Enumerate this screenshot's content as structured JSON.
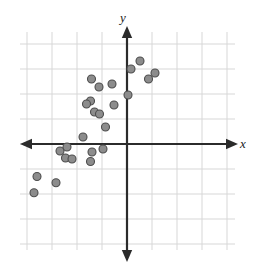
{
  "chart_data": {
    "type": "scatter",
    "title": "",
    "subtitle": "",
    "xlabel": "x",
    "ylabel": "y",
    "xlim": [
      -4.3,
      4.3
    ],
    "ylim": [
      -4.3,
      4.3
    ],
    "grid": true,
    "grid_spacing": 1,
    "legend": null,
    "annotations": [],
    "axes": {
      "x_axis_visible": true,
      "y_axis_visible": true,
      "x_axis_arrows": "both",
      "y_axis_arrows": "both",
      "tick_labels": false,
      "origin_label": ""
    },
    "series": [
      {
        "name": "data",
        "marker": "circle",
        "marker_fill": "#8c8c8c",
        "marker_edge": "#4d4d4d",
        "marker_size": 8,
        "points": [
          [
            -3.6,
            -1.3
          ],
          [
            -3.72,
            -1.95
          ],
          [
            -2.84,
            -1.55
          ],
          [
            -2.68,
            -0.28
          ],
          [
            -2.4,
            -0.12
          ],
          [
            -2.46,
            -0.56
          ],
          [
            -2.2,
            -0.6
          ],
          [
            -1.76,
            0.28
          ],
          [
            -1.4,
            -0.32
          ],
          [
            -1.46,
            -0.7
          ],
          [
            -0.96,
            -0.2
          ],
          [
            -0.86,
            0.68
          ],
          [
            -1.3,
            1.28
          ],
          [
            -1.46,
            1.72
          ],
          [
            -1.62,
            1.6
          ],
          [
            -1.1,
            1.2
          ],
          [
            -0.52,
            1.56
          ],
          [
            -1.12,
            2.28
          ],
          [
            -1.42,
            2.6
          ],
          [
            -0.6,
            2.4
          ],
          [
            0.04,
            1.96
          ],
          [
            0.16,
            3.0
          ],
          [
            0.52,
            3.32
          ],
          [
            0.86,
            2.6
          ],
          [
            1.12,
            2.84
          ]
        ]
      }
    ]
  },
  "geometry": {
    "origin_x": 127,
    "origin_y": 144,
    "unit": 25,
    "grid_left": 20,
    "grid_right": 235,
    "grid_top": 32,
    "grid_bottom": 250,
    "axis_color": "#2b2b2b",
    "grid_color": "#d7d7d7",
    "background": "#ffffff"
  },
  "labels": {
    "x": "x",
    "y": "y"
  }
}
